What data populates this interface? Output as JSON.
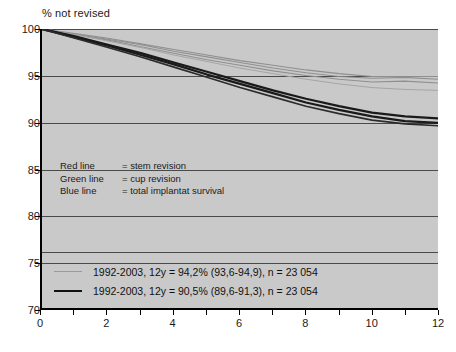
{
  "chart_data": {
    "type": "line",
    "title": "% not revised",
    "xlabel": "",
    "ylabel": "",
    "xlim": [
      0,
      12
    ],
    "ylim": [
      70,
      100
    ],
    "grid": true,
    "x_ticks": [
      0,
      2,
      4,
      6,
      8,
      10,
      12
    ],
    "x_tick_labels": [
      "0",
      "2",
      "4",
      "6",
      "8",
      "10",
      "12"
    ],
    "x_minor_ticks": [
      0,
      1,
      2,
      3,
      4,
      5,
      6,
      7,
      8,
      9,
      10,
      11,
      12
    ],
    "y_ticks": [
      70,
      75,
      80,
      85,
      90,
      95,
      100
    ],
    "y_tick_labels": [
      "70",
      "75",
      "80",
      "85",
      "90",
      "95",
      "100"
    ],
    "legend_position": "bottom-inside",
    "x": [
      0,
      1,
      2,
      3,
      4,
      5,
      6,
      7,
      8,
      9,
      10,
      11,
      12
    ],
    "series": [
      {
        "name": "stem revision upper",
        "color": "#8f8f8f",
        "width": 1.1,
        "values": [
          100,
          99.5,
          99.0,
          98.4,
          97.8,
          97.2,
          96.6,
          96.1,
          95.6,
          95.2,
          94.9,
          94.9,
          94.9
        ]
      },
      {
        "name": "cup revision upper",
        "color": "#8f8f8f",
        "width": 1.1,
        "values": [
          100,
          99.4,
          98.9,
          98.3,
          97.6,
          97.0,
          96.4,
          95.8,
          95.3,
          94.9,
          94.7,
          94.8,
          94.6
        ]
      },
      {
        "name": "total implantat survival upper",
        "color": "#8f8f8f",
        "width": 1.1,
        "values": [
          100,
          99.4,
          98.8,
          98.1,
          97.4,
          96.7,
          96.1,
          95.5,
          95.0,
          94.6,
          94.3,
          94.4,
          94.2
        ]
      },
      {
        "name": "confidence band light",
        "color": "#a5a5a5",
        "width": 1.0,
        "values": [
          100,
          99.4,
          98.7,
          98.0,
          97.2,
          96.5,
          95.8,
          95.2,
          94.6,
          94.1,
          93.7,
          93.5,
          93.4
        ]
      },
      {
        "name": "stem revision",
        "color": "#1a1a1a",
        "width": 2.2,
        "values": [
          100,
          99.2,
          98.3,
          97.4,
          96.4,
          95.4,
          94.4,
          93.4,
          92.5,
          91.7,
          91.0,
          90.6,
          90.4
        ]
      },
      {
        "name": "cup revision",
        "color": "#1a1a1a",
        "width": 2.2,
        "values": [
          100,
          99.1,
          98.2,
          97.2,
          96.2,
          95.1,
          94.1,
          93.1,
          92.1,
          91.3,
          90.6,
          90.1,
          89.9
        ]
      },
      {
        "name": "total implantat survival",
        "color": "#2b2b2b",
        "width": 1.6,
        "values": [
          100,
          99.0,
          98.0,
          97.0,
          95.9,
          94.8,
          93.7,
          92.7,
          91.7,
          90.9,
          90.2,
          89.8,
          89.6
        ]
      }
    ],
    "annotations": {
      "rows": [
        {
          "key": "Red line",
          "value": "= stem revision"
        },
        {
          "key": "Green line",
          "value": "= cup revision"
        },
        {
          "key": "Blue line",
          "value": "= total implantat survival"
        }
      ]
    },
    "legend": [
      {
        "style": "light",
        "label": "1992-2003, 12y = 94,2% (93,6-94,9), n = 23 054"
      },
      {
        "style": "dark",
        "label": "1992-2003, 12y = 90,5% (89,6-91,3), n = 23 054"
      }
    ],
    "colors": {
      "plot_background": "#c9c9c9",
      "gridline": "#4a4a4a",
      "axis": "#000000",
      "light_curve": "#8f8f8f",
      "dark_curve": "#1a1a1a"
    }
  }
}
